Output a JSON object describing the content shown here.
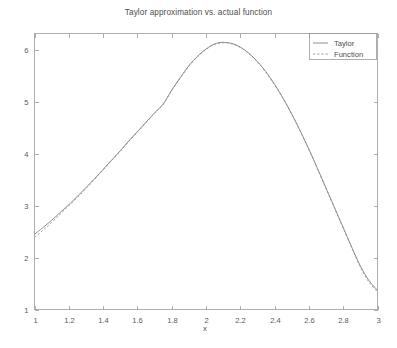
{
  "chart_data": {
    "type": "line",
    "title": "Taylor approximation vs. actual function",
    "xlabel": "x",
    "ylabel": "",
    "xlim": [
      1,
      3
    ],
    "ylim": [
      1,
      6.32
    ],
    "grid": false,
    "legend_position": "top-right",
    "background": "#ffffff",
    "axis_color": "#9a9a9a",
    "xticks": [
      1,
      1.2,
      1.4,
      1.6,
      1.8,
      2,
      2.2,
      2.4,
      2.6,
      2.8,
      3
    ],
    "xtick_labels": [
      "1",
      "1.2",
      "1.4",
      "1.6",
      "1.8",
      "2",
      "2.2",
      "2.4",
      "2.6",
      "2.8",
      "3"
    ],
    "yticks": [
      1,
      2,
      3,
      4,
      5,
      6
    ],
    "ytick_labels": [
      "1",
      "2",
      "3",
      "4",
      "5",
      "6"
    ],
    "x": [
      1.0,
      1.05,
      1.1,
      1.15,
      1.2,
      1.25,
      1.3,
      1.35,
      1.4,
      1.45,
      1.5,
      1.55,
      1.6,
      1.65,
      1.7,
      1.75,
      1.8,
      1.85,
      1.9,
      1.95,
      2.0,
      2.05,
      2.1,
      2.15,
      2.2,
      2.25,
      2.3,
      2.35,
      2.4,
      2.45,
      2.5,
      2.55,
      2.6,
      2.65,
      2.7,
      2.75,
      2.8,
      2.85,
      2.9,
      2.95,
      3.0
    ],
    "series": [
      {
        "name": "Taylor",
        "color": "#7d7d7d",
        "linestyle": "solid",
        "values": [
          2.45,
          2.58,
          2.72,
          2.87,
          3.02,
          3.18,
          3.35,
          3.52,
          3.7,
          3.88,
          4.06,
          4.25,
          4.43,
          4.61,
          4.79,
          4.96,
          5.23,
          5.47,
          5.7,
          5.88,
          6.02,
          6.12,
          6.15,
          6.13,
          6.06,
          5.94,
          5.78,
          5.58,
          5.34,
          5.07,
          4.77,
          4.44,
          4.09,
          3.72,
          3.34,
          2.96,
          2.58,
          2.2,
          1.84,
          1.56,
          1.37
        ]
      },
      {
        "name": "Function",
        "color": "#8d8d8d",
        "linestyle": "dashed",
        "values": [
          2.39,
          2.53,
          2.68,
          2.84,
          3.0,
          3.16,
          3.33,
          3.51,
          3.69,
          3.87,
          4.05,
          4.24,
          4.42,
          4.6,
          4.78,
          4.95,
          5.22,
          5.46,
          5.69,
          5.87,
          6.01,
          6.11,
          6.14,
          6.12,
          6.05,
          5.93,
          5.77,
          5.57,
          5.33,
          5.06,
          4.76,
          4.43,
          4.08,
          3.71,
          3.33,
          2.95,
          2.57,
          2.19,
          1.82,
          1.53,
          1.34
        ]
      }
    ],
    "legend": [
      {
        "label": "Taylor",
        "linestyle": "solid",
        "color": "#7d7d7d"
      },
      {
        "label": "Function",
        "linestyle": "dashed",
        "color": "#8d8d8d"
      }
    ]
  }
}
